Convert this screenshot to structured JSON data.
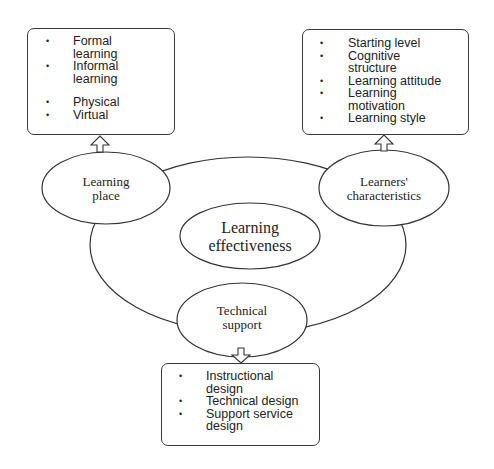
{
  "diagram": {
    "center": {
      "label_line1": "Learning",
      "label_line2": "effectiveness"
    },
    "nodes": {
      "learning_place": {
        "label_line1": "Learning",
        "label_line2": "place",
        "items": [
          "Formal learning",
          "Informal learning",
          "Physical",
          "Virtual"
        ],
        "item_lines": [
          [
            "Formal",
            "learning"
          ],
          [
            "Informal",
            "learning"
          ],
          [
            "Physical"
          ],
          [
            "Virtual"
          ]
        ]
      },
      "learners_characteristics": {
        "label_line1": "Learners'",
        "label_line2": "characteristics",
        "items": [
          "Starting level",
          "Cognitive structure",
          "Learning attitude",
          "Learning motivation",
          "Learning style"
        ],
        "item_lines": [
          [
            "Starting level"
          ],
          [
            "Cognitive",
            "structure"
          ],
          [
            "Learning attitude"
          ],
          [
            "Learning",
            "motivation"
          ],
          [
            "Learning style"
          ]
        ]
      },
      "technical_support": {
        "label_line1": "Technical",
        "label_line2": "support",
        "items": [
          "Instructional design",
          "Technical design",
          "Support service design"
        ],
        "item_lines": [
          [
            "Instructional",
            "design"
          ],
          [
            "Technical design"
          ],
          [
            "Support service",
            "design"
          ]
        ]
      }
    },
    "bullet": "•"
  }
}
